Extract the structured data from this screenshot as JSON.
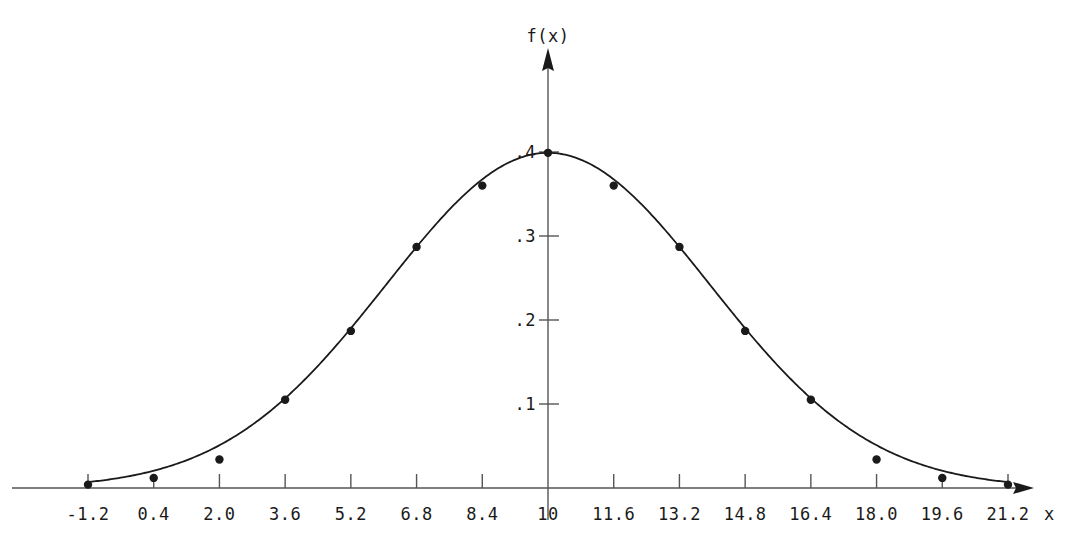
{
  "chart_data": {
    "type": "line",
    "title": "",
    "xlabel": "x",
    "ylabel": "f(x)",
    "grid": false,
    "legend": "none",
    "markers": true,
    "line_color": "#1a1a1a",
    "marker_color": "#1a1a1a",
    "axis_color": "#555555",
    "xlim": [
      -1.2,
      21.2
    ],
    "ylim": [
      0.0,
      0.43
    ],
    "x_ticks": [
      -1.2,
      0.4,
      2.0,
      3.6,
      5.2,
      6.8,
      8.4,
      10,
      11.6,
      13.2,
      14.8,
      16.4,
      18.0,
      19.6,
      21.2
    ],
    "x_tick_labels": [
      "-1.2",
      "0.4",
      "2.0",
      "3.6",
      "5.2",
      "6.8",
      "8.4",
      "10",
      "11.6",
      "13.2",
      "14.8",
      "16.4",
      "18.0",
      "19.6",
      "21.2"
    ],
    "y_ticks": [
      0.1,
      0.2,
      0.3,
      0.4
    ],
    "y_tick_labels": [
      ".1",
      ".2",
      ".3",
      ".4"
    ],
    "x": [
      -1.2,
      0.4,
      2.0,
      3.6,
      5.2,
      6.8,
      8.4,
      10,
      11.6,
      13.2,
      14.8,
      16.4,
      18.0,
      19.6,
      21.2
    ],
    "values": [
      0.004,
      0.012,
      0.034,
      0.105,
      0.187,
      0.287,
      0.36,
      0.399,
      0.36,
      0.287,
      0.187,
      0.105,
      0.034,
      0.012,
      0.004
    ],
    "peak_x": 10,
    "peak_y": 0.399,
    "x_axis_arrow": true,
    "y_axis_arrow": true
  },
  "axes": {
    "x_axis_title": "x",
    "y_axis_title": "f(x)"
  }
}
